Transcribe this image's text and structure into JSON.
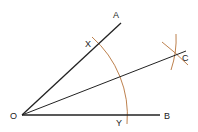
{
  "diagram": {
    "colors": {
      "line": "#222222",
      "arc": "#b5733a",
      "background": "#ffffff"
    },
    "points": {
      "O": {
        "label": "O",
        "x": 22,
        "y": 115
      },
      "A": {
        "label": "A",
        "x": 121,
        "y": 23
      },
      "B": {
        "label": "B",
        "x": 160,
        "y": 115
      },
      "C": {
        "label": "C",
        "x": 175,
        "y": 54
      },
      "X": {
        "label": "X",
        "x": 97,
        "y": 45
      },
      "Y": {
        "label": "Y",
        "x": 126,
        "y": 115
      }
    },
    "rays": [
      "OA",
      "OB",
      "OC"
    ],
    "arcs": [
      "arc-XY centered at O",
      "arc from X through C",
      "arc from Y through C"
    ]
  }
}
